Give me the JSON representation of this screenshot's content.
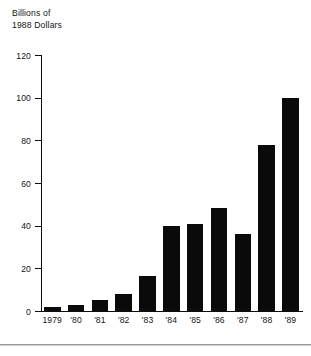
{
  "chart_data": {
    "type": "bar",
    "title": "",
    "subtitle": "",
    "ylabel_lines": [
      "Billions of",
      "1988 Dollars"
    ],
    "xlabel": "",
    "ylabel": "Billions of 1988 Dollars",
    "categories": [
      "1979",
      "'80",
      "'81",
      "'82",
      "'83",
      "'84",
      "'85",
      "'86",
      "'87",
      "'88",
      "'89"
    ],
    "values": [
      2,
      3,
      5,
      8,
      16.5,
      40,
      41,
      48.5,
      36,
      78,
      100
    ],
    "ylim": [
      0,
      120
    ],
    "yticks": [
      0,
      20,
      40,
      60,
      80,
      100,
      120
    ],
    "ytick_labels": [
      "0",
      "20",
      "40",
      "60",
      "80",
      "100",
      "120"
    ],
    "grid": false,
    "legend": null,
    "bar_color": "#0a0a0a",
    "axis_color": "#0d0d0d",
    "background": "#ffffff"
  },
  "footer": {
    "rule_color": "#9a9a9a"
  }
}
